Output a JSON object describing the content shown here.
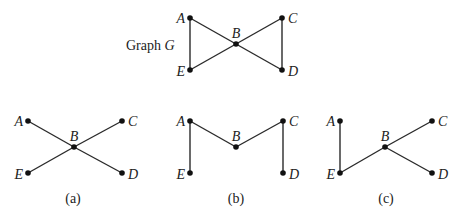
{
  "graph_title": {
    "prefix": "Graph ",
    "name": "G"
  },
  "nodes_labels": {
    "A": "A",
    "B": "B",
    "C": "C",
    "D": "D",
    "E": "E"
  },
  "graphs": [
    {
      "id": "G",
      "caption": "",
      "nodes": {
        "A": [
          190,
          18
        ],
        "B": [
          236,
          44
        ],
        "C": [
          282,
          18
        ],
        "D": [
          282,
          70
        ],
        "E": [
          190,
          70
        ]
      },
      "edges": [
        [
          "A",
          "E"
        ],
        [
          "A",
          "B"
        ],
        [
          "B",
          "D"
        ],
        [
          "E",
          "B"
        ],
        [
          "B",
          "C"
        ],
        [
          "C",
          "D"
        ]
      ]
    },
    {
      "id": "a",
      "caption": "(a)",
      "nodes": {
        "A": [
          28,
          121
        ],
        "B": [
          74,
          147
        ],
        "C": [
          122,
          121
        ],
        "D": [
          122,
          173
        ],
        "E": [
          28,
          173
        ]
      },
      "edges": [
        [
          "A",
          "B"
        ],
        [
          "B",
          "D"
        ],
        [
          "E",
          "B"
        ],
        [
          "B",
          "C"
        ]
      ]
    },
    {
      "id": "b",
      "caption": "(b)",
      "nodes": {
        "A": [
          190,
          121
        ],
        "B": [
          236,
          147
        ],
        "C": [
          283,
          121
        ],
        "D": [
          283,
          173
        ],
        "E": [
          190,
          173
        ]
      },
      "edges": [
        [
          "A",
          "E"
        ],
        [
          "A",
          "B"
        ],
        [
          "B",
          "C"
        ],
        [
          "C",
          "D"
        ]
      ]
    },
    {
      "id": "c",
      "caption": "(c)",
      "nodes": {
        "A": [
          340,
          121
        ],
        "B": [
          385,
          147
        ],
        "C": [
          432,
          121
        ],
        "D": [
          432,
          173
        ],
        "E": [
          340,
          173
        ]
      },
      "edges": [
        [
          "A",
          "E"
        ],
        [
          "E",
          "B"
        ],
        [
          "B",
          "C"
        ],
        [
          "B",
          "D"
        ]
      ]
    }
  ]
}
